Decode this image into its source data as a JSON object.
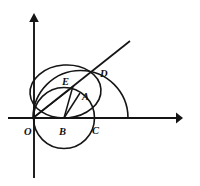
{
  "figure": {
    "background_color": "#ffffff",
    "stroke_color": "#151515",
    "axes": {
      "x_axis_name": "x-axis",
      "y_axis_name": "y-axis",
      "origin_label": "O"
    },
    "labels": {
      "O": "O",
      "A": "A",
      "B": "B",
      "C": "C",
      "D": "D",
      "E": "E"
    },
    "label_positions": {
      "O": {
        "x": 28,
        "y": 133
      },
      "B": {
        "x": 61,
        "y": 133
      },
      "C": {
        "x": 96,
        "y": 132
      },
      "E": {
        "x": 63,
        "y": 82
      },
      "A": {
        "x": 84,
        "y": 97
      },
      "D": {
        "x": 102,
        "y": 74
      }
    },
    "points": {
      "O": {
        "x": 33,
        "y": 118
      },
      "B": {
        "x": 64,
        "y": 118
      },
      "C": {
        "x": 94,
        "y": 118
      },
      "E": {
        "x": 72,
        "y": 87
      },
      "A": {
        "x": 80,
        "y": 94
      },
      "D": {
        "x": 95,
        "y": 73
      }
    },
    "shapes": {
      "small_circle": {
        "cx": 64,
        "cy": 118,
        "r": 30.5,
        "name": "circle-centered-at-B"
      },
      "large_arc": {
        "cx": 80,
        "cy": 118,
        "r": 48,
        "name": "semicircle-on-OC-extended"
      },
      "mid_circle": {
        "cx": 66,
        "cy": 92,
        "r": 26.5,
        "name": "circle-through-O-and-D"
      },
      "ray": {
        "from": "O",
        "through": "D",
        "end_x": 130,
        "end_y": 41
      },
      "segment_OE": {
        "from": "O",
        "to": "E"
      },
      "segment_BE": {
        "from": "B",
        "to": "E"
      },
      "segment_BA": {
        "from": "B",
        "to": "A"
      }
    },
    "axis_geometry": {
      "x_start_x": 8,
      "x_end_x": 183,
      "x_y": 118,
      "y_x": 34,
      "y_top_y": 13,
      "y_bottom_y": 178
    }
  }
}
